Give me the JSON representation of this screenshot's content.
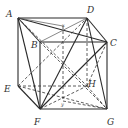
{
  "figure": {
    "type": "cube-geometry-diagram",
    "vertices": {
      "A": {
        "label": "A",
        "x": 18,
        "y": 18,
        "lx": 8,
        "ly": 17
      },
      "D": {
        "label": "D",
        "x": 87,
        "y": 18,
        "lx": 88,
        "ly": 13
      },
      "B": {
        "label": "B",
        "x": 40,
        "y": 42,
        "lx": 32,
        "ly": 48
      },
      "C": {
        "label": "C",
        "x": 107,
        "y": 42,
        "lx": 110,
        "ly": 45
      },
      "E": {
        "label": "E",
        "x": 18,
        "y": 86,
        "lx": 5,
        "ly": 91
      },
      "H": {
        "label": "H",
        "x": 87,
        "y": 86,
        "lx": 88,
        "ly": 86
      },
      "F": {
        "label": "F",
        "x": 40,
        "y": 109,
        "lx": 34,
        "ly": 125
      },
      "G": {
        "label": "G",
        "x": 107,
        "y": 109,
        "lx": 108,
        "ly": 125
      }
    },
    "points": {
      "X": {
        "label": "x",
        "x": 63,
        "y": 26
      },
      "Y": {
        "label": "y",
        "x": 63,
        "y": 101
      }
    },
    "labels": [
      "A",
      "B",
      "C",
      "D",
      "E",
      "F",
      "G",
      "H",
      "x",
      "y"
    ],
    "stroke_color": "#2a2a2a"
  }
}
